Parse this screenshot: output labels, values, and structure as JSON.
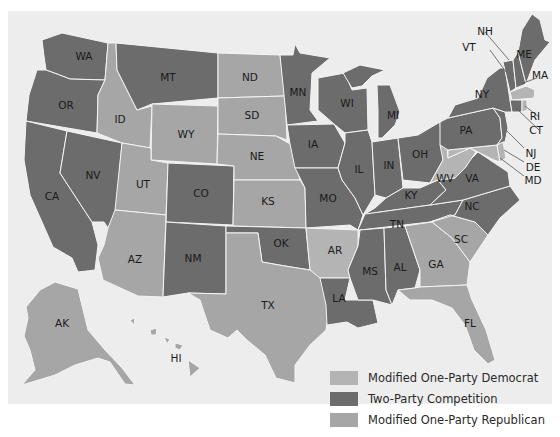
{
  "colors": {
    "modified_one_party_democrat": "#b4b4b4",
    "two_party_competition": "#6c6c6c",
    "modified_one_party_republican": "#a6a6a6",
    "background": "#ededed",
    "border": "#f4f4f4"
  },
  "legend": {
    "items": [
      {
        "key": "modified_one_party_democrat",
        "label": "Modified One-Party Democrat"
      },
      {
        "key": "two_party_competition",
        "label": "Two-Party Competition"
      },
      {
        "key": "modified_one_party_republican",
        "label": "Modified One-Party Republican"
      }
    ]
  },
  "states": {
    "WA": "two_party_competition",
    "OR": "two_party_competition",
    "CA": "two_party_competition",
    "NV": "two_party_competition",
    "ID": "modified_one_party_republican",
    "MT": "two_party_competition",
    "WY": "modified_one_party_republican",
    "UT": "modified_one_party_republican",
    "CO": "two_party_competition",
    "AZ": "modified_one_party_republican",
    "NM": "two_party_competition",
    "ND": "modified_one_party_republican",
    "SD": "modified_one_party_republican",
    "NE": "modified_one_party_republican",
    "KS": "modified_one_party_republican",
    "OK": "two_party_competition",
    "TX": "modified_one_party_republican",
    "MN": "two_party_competition",
    "IA": "two_party_competition",
    "MO": "two_party_competition",
    "AR": "modified_one_party_democrat",
    "LA": "two_party_competition",
    "WI": "two_party_competition",
    "IL": "two_party_competition",
    "MI": "two_party_competition",
    "IN": "two_party_competition",
    "OH": "two_party_competition",
    "KY": "two_party_competition",
    "TN": "two_party_competition",
    "MS": "two_party_competition",
    "AL": "two_party_competition",
    "GA": "modified_one_party_republican",
    "FL": "modified_one_party_republican",
    "SC": "modified_one_party_republican",
    "NC": "two_party_competition",
    "VA": "two_party_competition",
    "WV": "modified_one_party_democrat",
    "PA": "two_party_competition",
    "NY": "two_party_competition",
    "VT": "two_party_competition",
    "NH": "two_party_competition",
    "ME": "two_party_competition",
    "MA": "modified_one_party_democrat",
    "RI": "modified_one_party_democrat",
    "CT": "two_party_competition",
    "NJ": "two_party_competition",
    "DE": "modified_one_party_democrat",
    "MD": "modified_one_party_democrat",
    "AK": "modified_one_party_republican",
    "HI": "modified_one_party_republican"
  },
  "labels": {
    "WA": "WA",
    "OR": "OR",
    "CA": "CA",
    "NV": "NV",
    "ID": "ID",
    "MT": "MT",
    "WY": "WY",
    "UT": "UT",
    "CO": "CO",
    "AZ": "AZ",
    "NM": "NM",
    "ND": "ND",
    "SD": "SD",
    "NE": "NE",
    "KS": "KS",
    "OK": "OK",
    "TX": "TX",
    "MN": "MN",
    "IA": "IA",
    "MO": "MO",
    "AR": "AR",
    "LA": "LA",
    "WI": "WI",
    "IL": "IL",
    "MI": "MI",
    "IN": "IN",
    "OH": "OH",
    "KY": "KY",
    "TN": "TN",
    "MS": "MS",
    "AL": "AL",
    "GA": "GA",
    "FL": "FL",
    "SC": "SC",
    "NC": "NC",
    "VA": "VA",
    "WV": "WV",
    "PA": "PA",
    "NY": "NY",
    "VT": "VT",
    "NH": "NH",
    "ME": "ME",
    "MA": "MA",
    "RI": "RI",
    "CT": "CT",
    "NJ": "NJ",
    "DE": "DE",
    "MD": "MD",
    "AK": "AK",
    "HI": "HI"
  }
}
